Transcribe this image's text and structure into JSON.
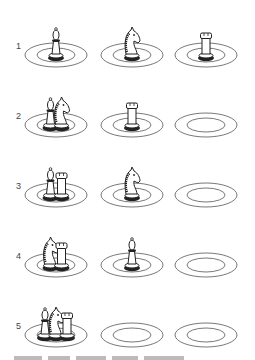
{
  "diagram": {
    "type": "puzzle-steps",
    "plate_count": 3,
    "steps": [
      {
        "label": "1",
        "plates": [
          [
            "bishop"
          ],
          [
            "knight"
          ],
          [
            "rook"
          ]
        ]
      },
      {
        "label": "2",
        "plates": [
          [
            "bishop",
            "knight"
          ],
          [
            "rook"
          ],
          []
        ]
      },
      {
        "label": "3",
        "plates": [
          [
            "bishop",
            "rook"
          ],
          [
            "knight"
          ],
          []
        ]
      },
      {
        "label": "4",
        "plates": [
          [
            "knight",
            "rook"
          ],
          [
            "bishop"
          ],
          []
        ]
      },
      {
        "label": "5",
        "plates": [
          [
            "bishop",
            "knight",
            "rook"
          ],
          [],
          []
        ]
      }
    ],
    "colors": {
      "line": "#555555",
      "piece_dark": "#222222",
      "label": "#444444"
    }
  }
}
